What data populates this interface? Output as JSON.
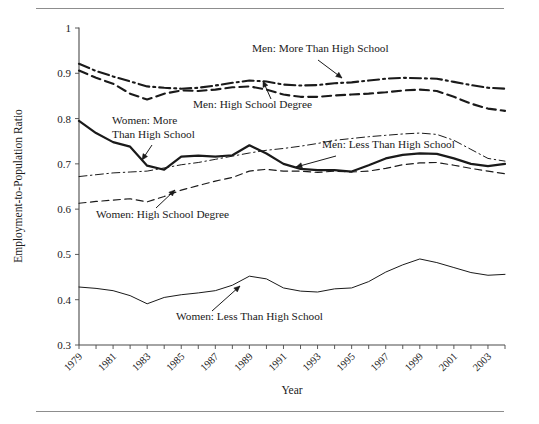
{
  "figure": {
    "has_top_rule": true,
    "has_bottom_rule": true
  },
  "chart_data": {
    "type": "line",
    "title": "",
    "xlabel": "Year",
    "ylabel": "Employment-to-Population Ratio",
    "xlim": [
      1979,
      2004
    ],
    "ylim": [
      0.3,
      1.0
    ],
    "grid": false,
    "legend_position": "inline-annotations",
    "ytick_labels": [
      "1",
      "0.9",
      "0.8",
      "0.7",
      "0.6",
      "0.5",
      "0.4",
      "0.3"
    ],
    "ytick_values": [
      1,
      0.9,
      0.8,
      0.7,
      0.6,
      0.5,
      0.4,
      0.3
    ],
    "x": [
      1979,
      1980,
      1981,
      1982,
      1983,
      1984,
      1985,
      1986,
      1987,
      1988,
      1989,
      1990,
      1991,
      1992,
      1993,
      1994,
      1995,
      1996,
      1997,
      1998,
      1999,
      2000,
      2001,
      2002,
      2003,
      2004
    ],
    "xtick_labels": [
      "1979",
      "1981",
      "1983",
      "1985",
      "1987",
      "1989",
      "1991",
      "1993",
      "1995",
      "1997",
      "1999",
      "2001",
      "2003"
    ],
    "xtick_label_values": [
      1979,
      1981,
      1983,
      1985,
      1987,
      1989,
      1991,
      1993,
      1995,
      1997,
      1999,
      2001,
      2003
    ],
    "series": [
      {
        "name": "Men: More Than High School",
        "style": "dash-dot",
        "width": 2.1,
        "color": "#1a1a1a",
        "values": [
          0.921,
          0.905,
          0.893,
          0.882,
          0.871,
          0.868,
          0.866,
          0.868,
          0.873,
          0.879,
          0.884,
          0.882,
          0.875,
          0.873,
          0.874,
          0.878,
          0.88,
          0.884,
          0.888,
          0.89,
          0.889,
          0.888,
          0.881,
          0.874,
          0.868,
          0.866
        ]
      },
      {
        "name": "Men: High School Degree",
        "style": "dashed",
        "width": 2.1,
        "color": "#1a1a1a",
        "values": [
          0.906,
          0.89,
          0.877,
          0.855,
          0.842,
          0.855,
          0.862,
          0.861,
          0.864,
          0.869,
          0.871,
          0.864,
          0.853,
          0.848,
          0.848,
          0.851,
          0.853,
          0.855,
          0.858,
          0.862,
          0.864,
          0.861,
          0.848,
          0.833,
          0.822,
          0.817
        ]
      },
      {
        "name": "Men: Less Than High School",
        "style": "thin-dash-dot",
        "width": 1.0,
        "color": "#3a3a3a",
        "values": [
          0.672,
          0.676,
          0.68,
          0.682,
          0.684,
          0.691,
          0.698,
          0.703,
          0.71,
          0.717,
          0.724,
          0.73,
          0.734,
          0.739,
          0.745,
          0.752,
          0.756,
          0.76,
          0.763,
          0.766,
          0.768,
          0.765,
          0.752,
          0.732,
          0.712,
          0.706
        ]
      },
      {
        "name": "Women: More Than High School",
        "style": "solid",
        "width": 2.2,
        "color": "#1a1a1a",
        "values": [
          0.795,
          0.768,
          0.748,
          0.738,
          0.696,
          0.687,
          0.716,
          0.718,
          0.716,
          0.719,
          0.741,
          0.723,
          0.7,
          0.689,
          0.686,
          0.686,
          0.683,
          0.697,
          0.712,
          0.72,
          0.723,
          0.722,
          0.712,
          0.7,
          0.695,
          0.7
        ]
      },
      {
        "name": "Women: High School Degree",
        "style": "thin-dashed",
        "width": 1.2,
        "color": "#3a3a3a",
        "values": [
          0.613,
          0.617,
          0.62,
          0.623,
          0.616,
          0.628,
          0.642,
          0.652,
          0.662,
          0.67,
          0.684,
          0.688,
          0.684,
          0.684,
          0.681,
          0.684,
          0.682,
          0.684,
          0.69,
          0.698,
          0.702,
          0.703,
          0.697,
          0.69,
          0.684,
          0.678
        ]
      },
      {
        "name": "Women: Less Than High School",
        "style": "thin-solid",
        "width": 1.0,
        "color": "#3a3a3a",
        "values": [
          0.428,
          0.425,
          0.42,
          0.409,
          0.391,
          0.405,
          0.411,
          0.415,
          0.42,
          0.432,
          0.452,
          0.446,
          0.426,
          0.419,
          0.417,
          0.424,
          0.426,
          0.44,
          0.461,
          0.477,
          0.49,
          0.482,
          0.471,
          0.46,
          0.454,
          0.456
        ]
      }
    ],
    "annotations": [
      {
        "text": "Men: More Than High School",
        "x": 252,
        "y": 52,
        "arrow": {
          "x1": 318,
          "y1": 60,
          "x2": 342,
          "y2": 78
        }
      },
      {
        "text": "Men: High School Degree",
        "x": 193,
        "y": 108,
        "arrow": {
          "x1": 271,
          "y1": 99,
          "x2": 263,
          "y2": 81
        }
      },
      {
        "text": "Men: Less Than High School",
        "x": 322,
        "y": 148,
        "arrow": {
          "x1": 336,
          "y1": 156,
          "x2": 296,
          "y2": 167
        }
      },
      {
        "text_line1": "Women: More",
        "text_line2": "Than High School",
        "x": 112,
        "y": 124,
        "arrow": {
          "x1": 152,
          "y1": 145,
          "x2": 142,
          "y2": 160
        }
      },
      {
        "text": "Women: High School Degree",
        "x": 96,
        "y": 218,
        "arrow": {
          "x1": 156,
          "y1": 208,
          "x2": 175,
          "y2": 190
        }
      },
      {
        "text": "Women: Less Than High School",
        "x": 176,
        "y": 320,
        "arrow": {
          "x1": 212,
          "y1": 311,
          "x2": 240,
          "y2": 286
        }
      }
    ]
  }
}
